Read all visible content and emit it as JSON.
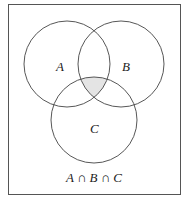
{
  "diagram": {
    "type": "venn",
    "sets": [
      {
        "label": "A",
        "cx": 67,
        "cy": 64,
        "r": 43
      },
      {
        "label": "B",
        "cx": 121,
        "cy": 64,
        "r": 43
      },
      {
        "label": "C",
        "cx": 94,
        "cy": 120,
        "r": 43
      }
    ],
    "shaded_region": "A ∩ B ∩ C",
    "shade_color": "#e4e4e4",
    "caption": "A ∩ B ∩ C"
  }
}
